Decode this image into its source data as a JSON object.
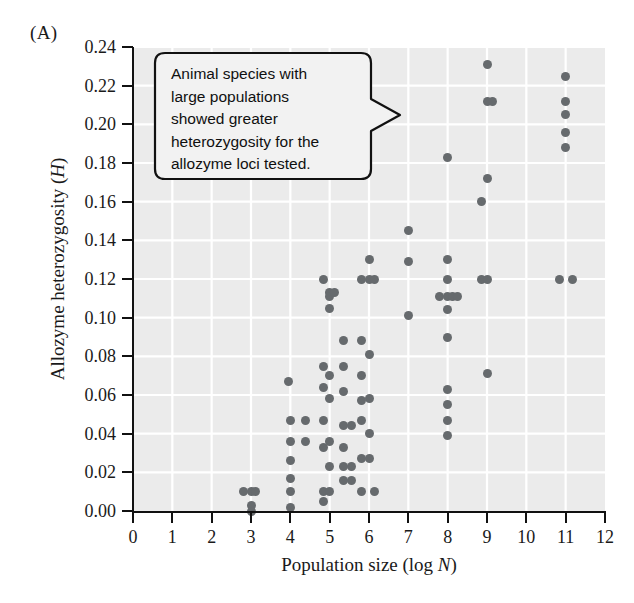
{
  "figure": {
    "panel_label": "(A)",
    "background_color": "#ffffff",
    "plot_background_color": "#ebebeb",
    "gridline_color": "#ffffff",
    "point_color": "#666a6d",
    "axis_color": "#111111"
  },
  "annotation": {
    "name": "callout-note",
    "text": "Animal species with large populations showed greater heterozygosity for the allozyme loci tested.",
    "lines": [
      "Animal species with",
      "large populations",
      "showed greater",
      "heterozygosity for the",
      "allozyme loci tested."
    ],
    "pointer_direction": "right"
  },
  "chart_data": {
    "type": "scatter",
    "title": "",
    "subtitle": "",
    "xlabel": "Population size (log N)",
    "xlabel_parts": {
      "text": "Population size (log ",
      "italic": "N",
      "tail": ")"
    },
    "ylabel": "Allozyme heterozygosity (H)",
    "ylabel_parts": {
      "text": "Allozyme heterozygosity (",
      "italic": "H",
      "tail": ")"
    },
    "xlim": [
      0,
      12
    ],
    "ylim": [
      0.0,
      0.24
    ],
    "xticks": [
      0,
      1,
      2,
      3,
      4,
      5,
      6,
      7,
      8,
      9,
      10,
      11,
      12
    ],
    "xtick_labels": [
      "0",
      "1",
      "2",
      "3",
      "4",
      "5",
      "6",
      "7",
      "8",
      "9",
      "10",
      "11",
      "12"
    ],
    "yticks": [
      0.0,
      0.02,
      0.04,
      0.06,
      0.08,
      0.1,
      0.12,
      0.14,
      0.16,
      0.18,
      0.2,
      0.22,
      0.24
    ],
    "ytick_labels": [
      "0.00",
      "0.02",
      "0.04",
      "0.06",
      "0.08",
      "0.10",
      "0.12",
      "0.14",
      "0.16",
      "0.18",
      "0.20",
      "0.22",
      "0.24"
    ],
    "grid": true,
    "grid_axis": "both",
    "legend": false,
    "marker": "circle",
    "marker_size": 9,
    "points": [
      [
        2.8,
        0.01
      ],
      [
        3.0,
        0.01
      ],
      [
        3.0,
        0.003
      ],
      [
        3.0,
        0.0
      ],
      [
        3.12,
        0.01
      ],
      [
        3.95,
        0.067
      ],
      [
        4.0,
        0.047
      ],
      [
        4.0,
        0.036
      ],
      [
        4.0,
        0.026
      ],
      [
        4.0,
        0.017
      ],
      [
        4.0,
        0.01
      ],
      [
        4.0,
        0.002
      ],
      [
        4.38,
        0.047
      ],
      [
        4.38,
        0.036
      ],
      [
        4.85,
        0.12
      ],
      [
        4.85,
        0.075
      ],
      [
        4.85,
        0.064
      ],
      [
        4.85,
        0.047
      ],
      [
        4.85,
        0.033
      ],
      [
        4.85,
        0.01
      ],
      [
        4.85,
        0.005
      ],
      [
        5.0,
        0.113
      ],
      [
        5.0,
        0.111
      ],
      [
        5.0,
        0.105
      ],
      [
        5.0,
        0.07
      ],
      [
        5.0,
        0.058
      ],
      [
        5.0,
        0.036
      ],
      [
        5.0,
        0.023
      ],
      [
        5.0,
        0.01
      ],
      [
        5.13,
        0.113
      ],
      [
        5.35,
        0.088
      ],
      [
        5.35,
        0.075
      ],
      [
        5.35,
        0.062
      ],
      [
        5.35,
        0.044
      ],
      [
        5.35,
        0.033
      ],
      [
        5.35,
        0.023
      ],
      [
        5.35,
        0.016
      ],
      [
        5.55,
        0.044
      ],
      [
        5.55,
        0.023
      ],
      [
        5.55,
        0.016
      ],
      [
        5.8,
        0.12
      ],
      [
        5.8,
        0.088
      ],
      [
        5.8,
        0.07
      ],
      [
        5.8,
        0.057
      ],
      [
        5.8,
        0.047
      ],
      [
        5.8,
        0.027
      ],
      [
        5.8,
        0.01
      ],
      [
        6.0,
        0.13
      ],
      [
        6.0,
        0.12
      ],
      [
        6.0,
        0.081
      ],
      [
        6.0,
        0.058
      ],
      [
        6.0,
        0.04
      ],
      [
        6.0,
        0.027
      ],
      [
        6.15,
        0.12
      ],
      [
        6.15,
        0.01
      ],
      [
        7.0,
        0.145
      ],
      [
        7.0,
        0.129
      ],
      [
        7.0,
        0.101
      ],
      [
        8.0,
        0.183
      ],
      [
        8.0,
        0.13
      ],
      [
        8.0,
        0.12
      ],
      [
        8.0,
        0.111
      ],
      [
        8.0,
        0.104
      ],
      [
        8.0,
        0.09
      ],
      [
        8.0,
        0.063
      ],
      [
        8.0,
        0.055
      ],
      [
        8.0,
        0.047
      ],
      [
        8.0,
        0.039
      ],
      [
        7.78,
        0.111
      ],
      [
        8.12,
        0.111
      ],
      [
        8.24,
        0.111
      ],
      [
        8.85,
        0.16
      ],
      [
        8.85,
        0.12
      ],
      [
        9.0,
        0.231
      ],
      [
        9.0,
        0.212
      ],
      [
        9.0,
        0.172
      ],
      [
        9.0,
        0.12
      ],
      [
        9.0,
        0.071
      ],
      [
        9.15,
        0.212
      ],
      [
        10.85,
        0.12
      ],
      [
        11.0,
        0.225
      ],
      [
        11.0,
        0.212
      ],
      [
        11.0,
        0.205
      ],
      [
        11.0,
        0.196
      ],
      [
        11.0,
        0.188
      ],
      [
        11.18,
        0.12
      ]
    ]
  }
}
